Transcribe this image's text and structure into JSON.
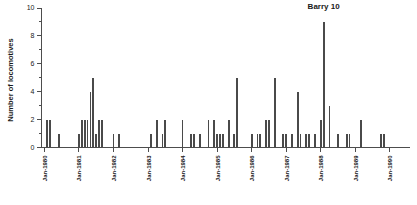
{
  "chart_data": {
    "type": "bar",
    "title": "",
    "xlabel": "",
    "ylabel": "Number of locomotives",
    "ylim": [
      0,
      10
    ],
    "ytick_labels": [
      "0",
      "2",
      "4",
      "6",
      "8",
      "10"
    ],
    "ytick_values": [
      0,
      2,
      4,
      6,
      8,
      10
    ],
    "yminor_values": [
      1,
      3,
      5,
      7,
      9
    ],
    "grid": false,
    "legend": null,
    "xtick_labels": [
      "Jan-1980",
      "Jan-1981",
      "Jan-1982",
      "Jan-1983",
      "Jan-1984",
      "Jan-1985",
      "Jan-1986",
      "Jan-1987",
      "Jan-1988",
      "Jan-1989",
      "Jan-1990"
    ],
    "xtick_positions": [
      0,
      12,
      24,
      36,
      48,
      60,
      72,
      84,
      96,
      108,
      120
    ],
    "x_range": [
      -1,
      127
    ],
    "annotations": [
      {
        "text": "Barry 10",
        "x": 97,
        "y": 10
      }
    ],
    "bar_color": "#4a4a4a",
    "categories": [
      "1980-01",
      "1980-02",
      "1980-03",
      "1980-04",
      "1980-05",
      "1980-06",
      "1980-07",
      "1980-08",
      "1980-09",
      "1980-10",
      "1980-11",
      "1980-12",
      "1981-01",
      "1981-02",
      "1981-03",
      "1981-04",
      "1981-05",
      "1981-06",
      "1981-07",
      "1981-08",
      "1981-09",
      "1981-10",
      "1981-11",
      "1981-12",
      "1982-01",
      "1982-02",
      "1982-03",
      "1982-04",
      "1982-05",
      "1982-06",
      "1982-07",
      "1982-08",
      "1982-09",
      "1982-10",
      "1982-11",
      "1982-12",
      "1983-01",
      "1983-02",
      "1983-03",
      "1983-04",
      "1983-05",
      "1983-06",
      "1983-07",
      "1983-08",
      "1983-09",
      "1983-10",
      "1983-11",
      "1983-12",
      "1984-01",
      "1984-02",
      "1984-03",
      "1984-04",
      "1984-05",
      "1984-06",
      "1984-07",
      "1984-08",
      "1984-09",
      "1984-10",
      "1984-11",
      "1984-12",
      "1985-01",
      "1985-02",
      "1985-03",
      "1985-04",
      "1985-05",
      "1985-06",
      "1985-07",
      "1985-08",
      "1985-09",
      "1985-10",
      "1985-11",
      "1985-12",
      "1986-01",
      "1986-02",
      "1986-03",
      "1986-04",
      "1986-05",
      "1986-06",
      "1986-07",
      "1986-08",
      "1986-09",
      "1986-10",
      "1986-11",
      "1986-12",
      "1987-01",
      "1987-02",
      "1987-03",
      "1987-04",
      "1987-05",
      "1987-06",
      "1987-07",
      "1987-08",
      "1987-09",
      "1987-10",
      "1987-11",
      "1987-12",
      "1988-01",
      "1988-02",
      "1988-03",
      "1988-04",
      "1988-05",
      "1988-06",
      "1988-07",
      "1988-08",
      "1988-09",
      "1988-10",
      "1988-11",
      "1988-12",
      "1989-01",
      "1989-02",
      "1989-03",
      "1989-04",
      "1989-05",
      "1989-06",
      "1989-07",
      "1989-08",
      "1989-09",
      "1989-10",
      "1989-11",
      "1989-12",
      "1990-01",
      "1990-02",
      "1990-03",
      "1990-04",
      "1990-05",
      "1990-06",
      "1990-07"
    ],
    "values": [
      0,
      2,
      2,
      0,
      0,
      1,
      0,
      0,
      0,
      0,
      0,
      0,
      1,
      2,
      2,
      2,
      4,
      5,
      1,
      2,
      2,
      0,
      0,
      0,
      1,
      0,
      1,
      0,
      0,
      0,
      0,
      0,
      0,
      0,
      0,
      0,
      0,
      1,
      0,
      2,
      0,
      1,
      2,
      0,
      0,
      0,
      0,
      0,
      2,
      0,
      0,
      1,
      1,
      0,
      1,
      0,
      0,
      2,
      0,
      2,
      1,
      1,
      1,
      0,
      2,
      0,
      1,
      5,
      0,
      0,
      0,
      0,
      1,
      0,
      1,
      1,
      0,
      2,
      2,
      0,
      5,
      0,
      0,
      1,
      1,
      0,
      1,
      0,
      4,
      1,
      0,
      1,
      1,
      0,
      1,
      0,
      2,
      9,
      0,
      3,
      0,
      0,
      1,
      0,
      0,
      1,
      1,
      0,
      0,
      0,
      2,
      0,
      0,
      0,
      0,
      0,
      0,
      1,
      1,
      0,
      0,
      0,
      0,
      0,
      0,
      0,
      0
    ]
  }
}
